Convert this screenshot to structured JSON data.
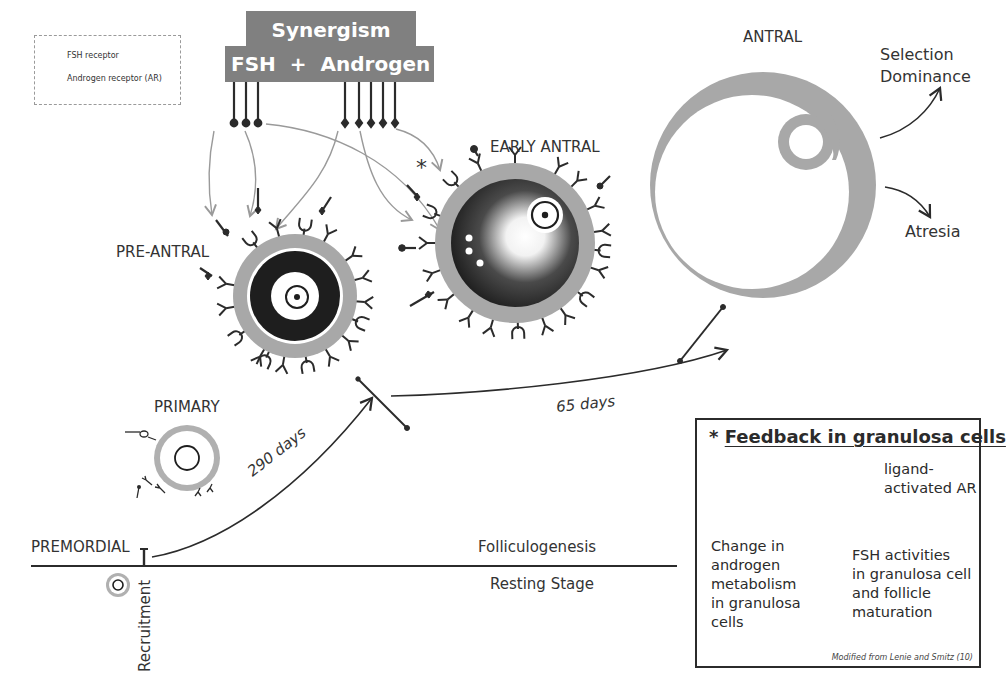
{
  "legend": {
    "fsh_receptor": "FSH receptor",
    "androgen_receptor": "Androgen receptor (AR)"
  },
  "synergism": {
    "title": "Synergism",
    "fsh": "FSH",
    "plus": "+",
    "androgen": "Androgen"
  },
  "stages": {
    "premordial": "PREMORDIAL",
    "primary": "PRIMARY",
    "pre_antral": "PRE-ANTRAL",
    "early_antral": "EARLY ANTRAL",
    "antral": "ANTRAL"
  },
  "outcomes": {
    "selection_line1": "Selection",
    "selection_line2": "Dominance",
    "atresia": "Atresia"
  },
  "timeline": {
    "recruitment": "Recruitment",
    "folliculogenesis": "Folliculogenesis",
    "resting_stage": "Resting Stage",
    "days_290": "290 days",
    "days_65": "65 days"
  },
  "asterisk": "*",
  "feedback": {
    "star": "*",
    "title": "Feedback in granulosa cells",
    "step1_line1": "ligand-",
    "step1_line2": "activated AR",
    "step2_line1": "FSH activities",
    "step2_line2": "in granulosa cell",
    "step2_line3": "and follicle",
    "step2_line4": "maturation",
    "step3_line1": "Change in",
    "step3_line2": "androgen",
    "step3_line3": "metabolism",
    "step3_line4": "in granulosa",
    "step3_line5": "cells",
    "credit": "Modified from Lenie and Smitz (10)"
  },
  "colors": {
    "gray_fill": "#808080",
    "ring_gray": "#a8a8a8",
    "arrow_gray": "#9a9a9a",
    "ink": "#2b2b2b"
  }
}
